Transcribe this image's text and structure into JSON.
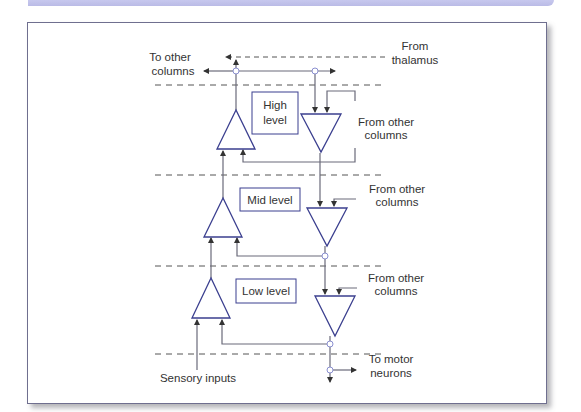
{
  "colors": {
    "banner": "#c1c2ea",
    "frame_border": "#6f6f8f",
    "neuron_stroke": "#3b3f8f",
    "line": "#6a6a7a",
    "dashed": "#555555",
    "node_fill": "#ffffff",
    "node_stroke": "#8a8fd0",
    "text": "#333333"
  },
  "levels": [
    {
      "id": "high",
      "label_line1": "High",
      "label_line2": "level"
    },
    {
      "id": "mid",
      "label": "Mid level"
    },
    {
      "id": "low",
      "label": "Low level"
    }
  ],
  "labels": {
    "to_other_columns_1": "To other",
    "to_other_columns_2": "columns",
    "from_thalamus_1": "From",
    "from_thalamus_2": "thalamus",
    "from_other_high_1": "From other",
    "from_other_high_2": "columns",
    "from_other_mid_1": "From other",
    "from_other_mid_2": "columns",
    "from_other_low_1": "From other",
    "from_other_low_2": "columns",
    "to_motor_1": "To motor",
    "to_motor_2": "neurons",
    "sensory_inputs": "Sensory inputs"
  }
}
